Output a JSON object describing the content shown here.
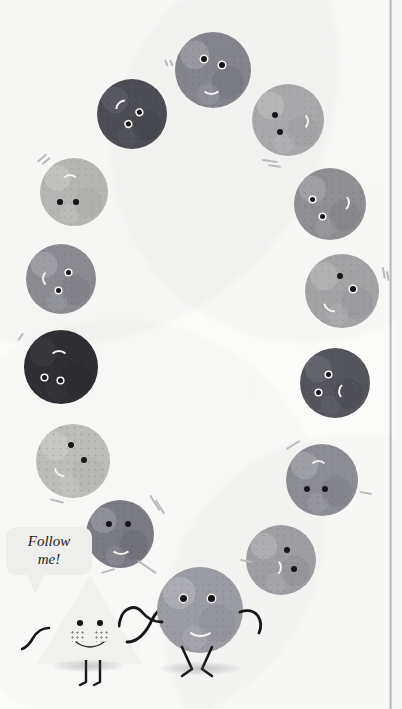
{
  "page": {
    "background_color": "#fcfcfa",
    "width": 402,
    "height": 709,
    "binding_edge_color": "#787a7e"
  },
  "speech_bubble": {
    "line1": "Follow",
    "line2": "me!",
    "full_text": "Follow me!",
    "background_color": "#eeeeec",
    "text_color": "#1d1d20"
  },
  "leader": {
    "name": "triangle-character",
    "shape": "triangle",
    "fill_color": "#f1f1ee",
    "eye_color": "#17171a",
    "mouth_color": "#2b2b2e",
    "has_freckles": true,
    "has_arms": true,
    "has_legs": true
  },
  "follower": {
    "name": "circle-character",
    "shape": "circle",
    "fill_color": "#9b9ba3",
    "eye_color": "#17171a",
    "mouth_color": "#f2f2ef",
    "has_arms": true,
    "has_legs": true
  },
  "pebbles": [
    {
      "id": "pebble-1",
      "color": "#84848d",
      "eye_style": "dark",
      "mouth_color": "#f2f2ef",
      "rotation": 0
    },
    {
      "id": "pebble-2",
      "color": "#4c4c55",
      "eye_style": "ring",
      "mouth_color": "#e8e8e4",
      "rotation": -30
    },
    {
      "id": "pebble-3",
      "color": "#a8a8ab",
      "eye_style": "dark",
      "mouth_color": "#f4f4f1",
      "rotation": 105
    },
    {
      "id": "pebble-4",
      "color": "#b5b5b3",
      "eye_style": "dark",
      "mouth_color": "#f6f6f3",
      "rotation": 180
    },
    {
      "id": "pebble-5",
      "color": "#8e8e93",
      "eye_style": "ring",
      "mouth_color": "#eeeeea",
      "rotation": 80
    },
    {
      "id": "pebble-6",
      "color": "#8a8a91",
      "eye_style": "dark",
      "mouth_color": "#f0f0ed",
      "rotation": -95
    },
    {
      "id": "pebble-7",
      "color": "#a3a3a6",
      "eye_style": "ring",
      "mouth_color": "#f3f3f0",
      "rotation": 115
    },
    {
      "id": "pebble-8",
      "color": "#2e2e33",
      "eye_style": "ring",
      "mouth_color": "#e6e6e2",
      "rotation": 180
    },
    {
      "id": "pebble-9",
      "color": "#55555e",
      "eye_style": "ring",
      "mouth_color": "#e9e9e5",
      "rotation": 95
    },
    {
      "id": "pebble-10",
      "color": "#bcbcb9",
      "eye_style": "dark",
      "mouth_color": "#f7f7f4",
      "rotation": -100
    },
    {
      "id": "pebble-11",
      "color": "#8c8c94",
      "eye_style": "dark",
      "mouth_color": "#f1f1ee",
      "rotation": 175
    },
    {
      "id": "pebble-12",
      "color": "#7b7b84",
      "eye_style": "dark",
      "mouth_color": "#f0f0ec",
      "rotation": 10
    },
    {
      "id": "pebble-13",
      "color": "#9e9ea2",
      "eye_style": "dark",
      "mouth_color": "#f3f3f0",
      "rotation": 100
    }
  ]
}
